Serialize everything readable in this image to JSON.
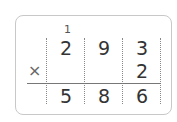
{
  "problem": {
    "carry": "1",
    "multiplicand": [
      "2",
      "9",
      "3"
    ],
    "multiplier": [
      "",
      "",
      "2"
    ],
    "operator": "×",
    "product": [
      "5",
      "8",
      "6"
    ]
  }
}
